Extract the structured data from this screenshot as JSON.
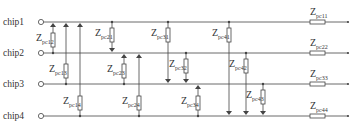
{
  "diagram": {
    "colors": {
      "line": "#444444",
      "text": "#333333",
      "background": "#ffffff"
    },
    "rails": [
      {
        "label": "chip1",
        "y": 22,
        "series_impedance": {
          "main": "Z",
          "sub": "pc11"
        }
      },
      {
        "label": "chip2",
        "y": 53,
        "series_impedance": {
          "main": "Z",
          "sub": "pc22"
        }
      },
      {
        "label": "chip3",
        "y": 84,
        "series_impedance": {
          "main": "Z",
          "sub": "pc33"
        }
      },
      {
        "label": "chip4",
        "y": 116,
        "series_impedance": {
          "main": "Z",
          "sub": "pc44"
        }
      }
    ],
    "couplings": [
      {
        "sub": "pc12",
        "x": 53,
        "from": 1,
        "to": 2,
        "arrow_end": 1
      },
      {
        "sub": "pc13",
        "x": 66,
        "from": 1,
        "to": 3,
        "arrow_end": 1
      },
      {
        "sub": "pc14",
        "x": 80,
        "from": 1,
        "to": 4,
        "arrow_end": 1
      },
      {
        "sub": "pc21",
        "x": 112,
        "from": 1,
        "to": 2,
        "arrow_end": 2
      },
      {
        "sub": "pc23",
        "x": 124,
        "from": 2,
        "to": 3,
        "arrow_end": 2
      },
      {
        "sub": "pc24",
        "x": 139,
        "from": 2,
        "to": 4,
        "arrow_end": 2
      },
      {
        "sub": "pc31",
        "x": 168,
        "from": 1,
        "to": 3,
        "arrow_end": 3
      },
      {
        "sub": "pc32",
        "x": 186,
        "from": 2,
        "to": 3,
        "arrow_end": 3
      },
      {
        "sub": "pc34",
        "x": 198,
        "from": 3,
        "to": 4,
        "arrow_end": 3
      },
      {
        "sub": "pc41",
        "x": 229,
        "from": 1,
        "to": 4,
        "arrow_end": 4
      },
      {
        "sub": "pc42",
        "x": 246,
        "from": 2,
        "to": 4,
        "arrow_end": 4
      },
      {
        "sub": "pc43",
        "x": 263,
        "from": 3,
        "to": 4,
        "arrow_end": 4
      }
    ]
  }
}
